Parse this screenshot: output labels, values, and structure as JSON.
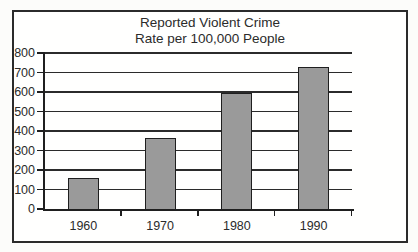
{
  "chart_data": {
    "type": "bar",
    "title": "Reported Violent Crime\nRate per 100,000 People",
    "categories": [
      "1960",
      "1970",
      "1980",
      "1990"
    ],
    "values": [
      160,
      365,
      597,
      730
    ],
    "xlabel": "",
    "ylabel": "",
    "ylim": [
      0,
      800
    ],
    "ytick_step": 100,
    "yticks": [
      0,
      100,
      200,
      300,
      400,
      500,
      600,
      700,
      800
    ],
    "grid": true,
    "legend": false,
    "colors": {
      "bar_fill": "#9a9a9a",
      "bar_border": "#1f1f1f",
      "grid_line": "#2b2b2b",
      "axis_line": "#1f1f1f",
      "text": "#2b2b2b",
      "frame_border": "#2b2b2b",
      "plot_background": "#fffffe"
    }
  }
}
